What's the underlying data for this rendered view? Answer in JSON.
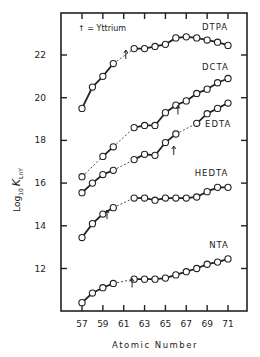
{
  "chart_data": {
    "type": "line",
    "title": "",
    "xlabel": "Atomic Number",
    "ylabel": "Log10 K_LnY",
    "ylabel_parts": {
      "main": "Log",
      "sub1": "10",
      "k": "K",
      "sub2": "LnY"
    },
    "xlim": [
      57,
      71
    ],
    "ylim": [
      10,
      23.8
    ],
    "x_ticks": [
      57,
      58,
      59,
      60,
      61,
      62,
      63,
      64,
      65,
      66,
      67,
      68,
      69,
      70,
      71
    ],
    "x_tick_labels": [
      "57",
      "59",
      "61",
      "63",
      "65",
      "67",
      "69",
      "71"
    ],
    "y_ticks": [
      12,
      14,
      16,
      18,
      20,
      22
    ],
    "y_tick_labels": [
      "12",
      "14",
      "16",
      "18",
      "20",
      "22"
    ],
    "grid": false,
    "legend": "inline labels at right end of each curve",
    "annotation": "↑ = Yttrium",
    "note": "Y values plotted at positions indicated by arrow marks; dashed lines bridge the gap at atomic number 61 (Pm)",
    "series": [
      {
        "name": "DTPA",
        "x": [
          57,
          58,
          59,
          60,
          62,
          63,
          64,
          65,
          66,
          67,
          68,
          69,
          70,
          71
        ],
        "values": [
          19.5,
          20.5,
          21.0,
          21.6,
          22.3,
          22.3,
          22.4,
          22.5,
          22.8,
          22.85,
          22.8,
          22.7,
          22.6,
          22.45
        ],
        "yttrium_x": 61.2,
        "yttrium_y": 22.0,
        "label_pos": [
          68.5,
          23.15
        ]
      },
      {
        "name": "DCTA",
        "x": [
          57,
          59,
          60,
          62,
          63,
          64,
          65,
          66,
          67,
          68,
          69,
          70,
          71
        ],
        "values": [
          16.3,
          17.25,
          17.7,
          18.6,
          18.7,
          18.7,
          19.3,
          19.65,
          19.85,
          20.2,
          20.4,
          20.7,
          20.9
        ],
        "yttrium_x": 66.2,
        "yttrium_y": 19.4,
        "label_pos": [
          68.5,
          21.3
        ]
      },
      {
        "name": "EDTA",
        "x": [
          57,
          58,
          59,
          60,
          62,
          63,
          64,
          65,
          66,
          68,
          69,
          70,
          71
        ],
        "values": [
          15.55,
          16.0,
          16.4,
          16.6,
          17.1,
          17.35,
          17.3,
          17.9,
          18.3,
          18.8,
          19.25,
          19.5,
          19.75
        ],
        "yttrium_x": 65.8,
        "yttrium_y": 17.5,
        "label_pos": [
          68.8,
          18.65
        ]
      },
      {
        "name": "HEDTA",
        "x": [
          57,
          58,
          59,
          60,
          62,
          63,
          64,
          65,
          66,
          67,
          68,
          69,
          70,
          71
        ],
        "values": [
          13.45,
          14.1,
          14.55,
          14.85,
          15.3,
          15.3,
          15.2,
          15.3,
          15.3,
          15.3,
          15.35,
          15.6,
          15.8,
          15.8
        ],
        "yttrium_x": 59.4,
        "yttrium_y": 14.5,
        "label_pos": [
          67.8,
          16.35
        ]
      },
      {
        "name": "NTA",
        "x": [
          57,
          58,
          59,
          60,
          62,
          63,
          64,
          65,
          66,
          67,
          68,
          69,
          70,
          71
        ],
        "values": [
          10.4,
          10.85,
          11.1,
          11.3,
          11.5,
          11.5,
          11.5,
          11.55,
          11.7,
          11.85,
          12.0,
          12.2,
          12.3,
          12.45
        ],
        "yttrium_x": 61.8,
        "yttrium_y": 11.3,
        "label_pos": [
          69.2,
          12.95
        ]
      }
    ]
  },
  "colors": {
    "ink": "#222222",
    "background": "#ffffff",
    "marker_fill": "#ffffff"
  }
}
